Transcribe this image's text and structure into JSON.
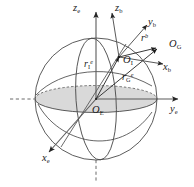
{
  "figure": {
    "type": "3d-coordinate-frame-diagram",
    "background_color": "#ffffff",
    "line_color": "#3a3a3a",
    "shade_color": "#d2d2d2",
    "text_color": "#1a1a1a"
  },
  "axes": {
    "earth_frame": [
      {
        "name": "z-earth-axis",
        "base": "z",
        "sub": "e",
        "direction": "up"
      },
      {
        "name": "y-earth-axis",
        "base": "y",
        "sub": "e",
        "direction": "right"
      },
      {
        "name": "x-earth-axis",
        "base": "x",
        "sub": "e",
        "direction": "down-left"
      }
    ],
    "body_frame": [
      {
        "name": "z-body-axis",
        "base": "z",
        "sub": "b",
        "direction": "up-slightly-right"
      },
      {
        "name": "y-body-axis",
        "base": "y",
        "sub": "b",
        "direction": "up-right"
      },
      {
        "name": "x-body-axis",
        "base": "x",
        "sub": "b",
        "direction": "right-slightly-down"
      }
    ]
  },
  "origins": [
    {
      "name": "earth-center-origin",
      "base": "O",
      "sub": "E"
    },
    {
      "name": "body-origin",
      "base": "O",
      "sub": "I"
    },
    {
      "name": "target-point-origin",
      "base": "O",
      "sub": "G"
    }
  ],
  "vectors": [
    {
      "name": "vector-r-I-e",
      "base": "r",
      "sub": "I",
      "sup": "e"
    },
    {
      "name": "vector-r-G-e",
      "base": "r",
      "sub": "G",
      "sup": "e"
    },
    {
      "name": "vector-r-b",
      "base": "r",
      "sub": "",
      "sup": "b"
    }
  ],
  "labels": {
    "z_e": {
      "base": "z",
      "sub": "e"
    },
    "z_b": {
      "base": "z",
      "sub": "b"
    },
    "y_b": {
      "base": "y",
      "sub": "b"
    },
    "x_b": {
      "base": "x",
      "sub": "b"
    },
    "y_e": {
      "base": "y",
      "sub": "e"
    },
    "x_e": {
      "base": "x",
      "sub": "e"
    },
    "O_E": {
      "base": "O",
      "sub": "E"
    },
    "O_I": {
      "base": "O",
      "sub": "I"
    },
    "O_G": {
      "base": "O",
      "sub": "G"
    },
    "r_I_e": {
      "base": "r",
      "sub": "I",
      "sup": "e"
    },
    "r_G_e": {
      "base": "r",
      "sub": "G",
      "sup": "e"
    },
    "r_b": {
      "base": "r",
      "sup": "b"
    }
  }
}
